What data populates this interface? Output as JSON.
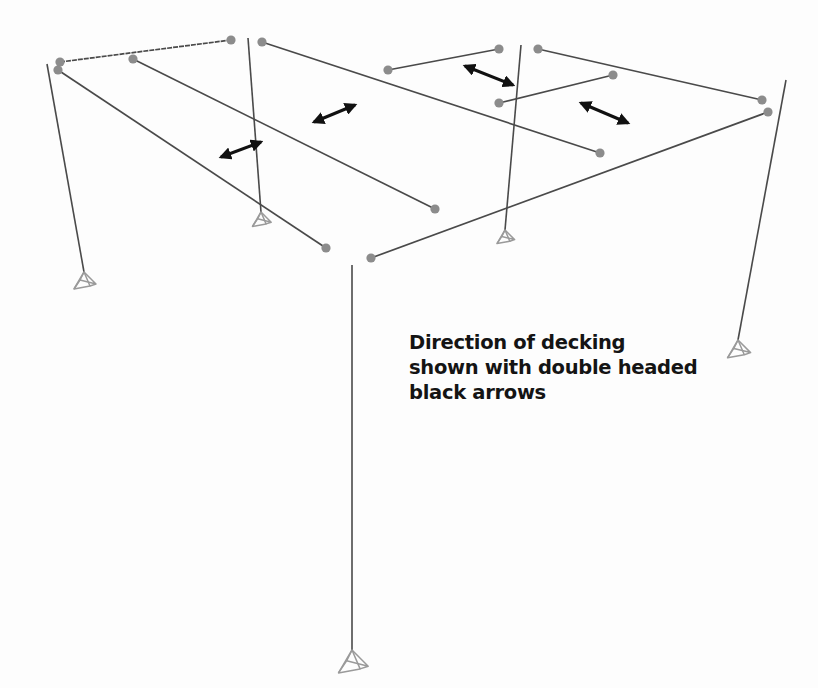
{
  "diagram": {
    "caption_lines": [
      "Direction of decking",
      "shown with double headed",
      "black arrows"
    ],
    "colors": {
      "background": "#fdfdfd",
      "member": "#4a4a4a",
      "node": "#8c8c8c",
      "support": "#9a9a9a",
      "arrow": "#111111",
      "caption": "#141414"
    },
    "beams": [
      {
        "id": "beam-top-left",
        "x1": 60,
        "y1": 62,
        "x2": 231,
        "y2": 40,
        "dashed": true
      },
      {
        "id": "beam-left-long",
        "x1": 58,
        "y1": 70,
        "x2": 326,
        "y2": 248
      },
      {
        "id": "beam-left-inner",
        "x1": 133,
        "y1": 59,
        "x2": 435,
        "y2": 209
      },
      {
        "id": "beam-mid-long",
        "x1": 262,
        "y1": 42,
        "x2": 600,
        "y2": 153
      },
      {
        "id": "beam-top-center",
        "x1": 388,
        "y1": 70,
        "x2": 499,
        "y2": 49
      },
      {
        "id": "beam-top-right",
        "x1": 538,
        "y1": 49,
        "x2": 762,
        "y2": 100
      },
      {
        "id": "beam-center-short",
        "x1": 499,
        "y1": 103,
        "x2": 613,
        "y2": 75
      },
      {
        "id": "beam-front-right",
        "x1": 371,
        "y1": 258,
        "x2": 768,
        "y2": 112
      }
    ],
    "nodes": [
      {
        "x": 60,
        "y": 62
      },
      {
        "x": 58,
        "y": 70
      },
      {
        "x": 133,
        "y": 59
      },
      {
        "x": 231,
        "y": 40
      },
      {
        "x": 262,
        "y": 42
      },
      {
        "x": 326,
        "y": 248
      },
      {
        "x": 435,
        "y": 209
      },
      {
        "x": 600,
        "y": 153
      },
      {
        "x": 388,
        "y": 70
      },
      {
        "x": 499,
        "y": 49
      },
      {
        "x": 538,
        "y": 49
      },
      {
        "x": 762,
        "y": 100
      },
      {
        "x": 499,
        "y": 103
      },
      {
        "x": 613,
        "y": 75
      },
      {
        "x": 371,
        "y": 258
      },
      {
        "x": 768,
        "y": 112
      }
    ],
    "columns": [
      {
        "id": "column-left",
        "x1": 47,
        "y1": 64,
        "x2": 84,
        "y2": 272
      },
      {
        "id": "column-mid-left",
        "x1": 248,
        "y1": 38,
        "x2": 261,
        "y2": 212
      },
      {
        "id": "column-mid-right",
        "x1": 521,
        "y1": 45,
        "x2": 505,
        "y2": 230
      },
      {
        "id": "column-right",
        "x1": 786,
        "y1": 80,
        "x2": 738,
        "y2": 340
      },
      {
        "id": "column-front",
        "x1": 352,
        "y1": 265,
        "x2": 352,
        "y2": 650
      }
    ],
    "supports": [
      {
        "id": "support-left",
        "x": 84,
        "y": 272,
        "scale": 1.0
      },
      {
        "id": "support-mid-left",
        "x": 261,
        "y": 212,
        "scale": 0.85
      },
      {
        "id": "support-mid-right",
        "x": 505,
        "y": 230,
        "scale": 0.8
      },
      {
        "id": "support-right",
        "x": 738,
        "y": 340,
        "scale": 1.05
      },
      {
        "id": "support-front",
        "x": 352,
        "y": 650,
        "scale": 1.35
      }
    ],
    "arrows": [
      {
        "id": "decking-arrow-1",
        "x1": 221,
        "y1": 157,
        "x2": 261,
        "y2": 142
      },
      {
        "id": "decking-arrow-2",
        "x1": 314,
        "y1": 122,
        "x2": 355,
        "y2": 105
      },
      {
        "id": "decking-arrow-3",
        "x1": 465,
        "y1": 66,
        "x2": 513,
        "y2": 85
      },
      {
        "id": "decking-arrow-4",
        "x1": 581,
        "y1": 103,
        "x2": 628,
        "y2": 123
      }
    ]
  }
}
